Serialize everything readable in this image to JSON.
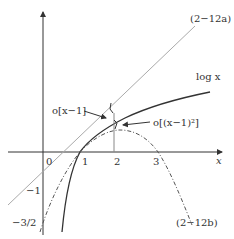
{
  "figure": {
    "type": "mathematical diagram",
    "labels": {
      "tangent_line": "(2−12a)",
      "parabola": "(2−12b)",
      "log_curve": "log x",
      "error_linear": "o[x−1]",
      "error_quadratic": "o[(x−1)²]",
      "x_axis": "x"
    },
    "x_ticks": [
      "0",
      "1",
      "2",
      "3"
    ],
    "y_ticks": [
      "−1",
      "−3/2"
    ],
    "colors": {
      "axis": "#333333",
      "log_curve": "#333333",
      "tangent_line": "#999999",
      "parabola": "#555555"
    }
  }
}
